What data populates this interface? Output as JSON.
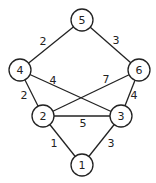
{
  "graph": {
    "nodes": [
      {
        "id": "1",
        "label": "1",
        "x": 82,
        "y": 165
      },
      {
        "id": "2",
        "label": "2",
        "x": 43,
        "y": 116
      },
      {
        "id": "3",
        "label": "3",
        "x": 121,
        "y": 116
      },
      {
        "id": "4",
        "label": "4",
        "x": 20,
        "y": 70
      },
      {
        "id": "5",
        "label": "5",
        "x": 82,
        "y": 20
      },
      {
        "id": "6",
        "label": "6",
        "x": 139,
        "y": 70
      }
    ],
    "edges": [
      {
        "from": "5",
        "to": "4",
        "weight": "2",
        "lx": 43,
        "ly": 41
      },
      {
        "from": "5",
        "to": "6",
        "weight": "3",
        "lx": 116,
        "ly": 40
      },
      {
        "from": "4",
        "to": "3",
        "weight": "4",
        "lx": 53,
        "ly": 80
      },
      {
        "from": "6",
        "to": "2",
        "weight": "7",
        "lx": 106,
        "ly": 79
      },
      {
        "from": "4",
        "to": "2",
        "weight": "2",
        "lx": 24,
        "ly": 95
      },
      {
        "from": "6",
        "to": "3",
        "weight": "4",
        "lx": 134,
        "ly": 95
      },
      {
        "from": "2",
        "to": "3",
        "weight": "5",
        "lx": 83,
        "ly": 123
      },
      {
        "from": "2",
        "to": "1",
        "weight": "1",
        "lx": 54,
        "ly": 143
      },
      {
        "from": "3",
        "to": "1",
        "weight": "3",
        "lx": 111,
        "ly": 143
      }
    ],
    "node_radius": 11
  }
}
